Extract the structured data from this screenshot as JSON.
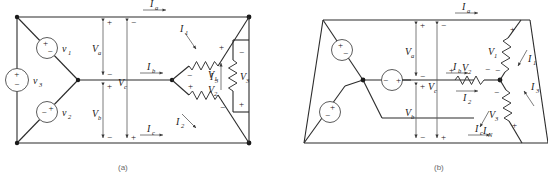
{
  "figure": {
    "caption_a": "(a)",
    "caption_b": "(b)"
  },
  "diagram_a": {
    "sources": [
      {
        "name": "v1",
        "label": "v",
        "sub": "1",
        "polarity_top": "+",
        "polarity_bottom": "−"
      },
      {
        "name": "v2",
        "label": "v",
        "sub": "2",
        "polarity_top": "−",
        "polarity_bottom": "+"
      },
      {
        "name": "v3",
        "label": "v",
        "sub": "3",
        "polarity_top": "+",
        "polarity_bottom": "−"
      }
    ],
    "resistors": [
      {
        "name": "V1",
        "label": "V",
        "sub": "1",
        "sign_near": "+",
        "sign_far": "−"
      },
      {
        "name": "V2",
        "label": "V",
        "sub": "2",
        "sign_near": "+",
        "sign_far": "−"
      },
      {
        "name": "V3",
        "label": "V",
        "sub": "3",
        "sign_near": "−",
        "sign_far": "+"
      }
    ],
    "line_voltages": [
      {
        "name": "Va",
        "label": "V",
        "sub": "a",
        "sign_top": "+",
        "sign_bottom": "−"
      },
      {
        "name": "Vb",
        "label": "V",
        "sub": "b",
        "sign_top": "+",
        "sign_bottom": "−"
      },
      {
        "name": "Vc",
        "label": "V",
        "sub": "c",
        "sign_top": "−",
        "sign_bottom": "+"
      }
    ],
    "line_currents": [
      {
        "name": "Ia",
        "label": "I",
        "sub": "a",
        "direction": "right"
      },
      {
        "name": "Ib",
        "label": "I",
        "sub": "b",
        "direction": "right"
      },
      {
        "name": "Ic",
        "label": "I",
        "sub": "c",
        "direction": "right"
      }
    ],
    "branch_currents": [
      {
        "name": "I1",
        "label": "I",
        "sub": "1",
        "direction": "down-right"
      },
      {
        "name": "I2",
        "label": "I",
        "sub": "2",
        "direction": "down-right"
      },
      {
        "name": "I3",
        "label": "I",
        "sub": "3",
        "direction": "up"
      }
    ]
  },
  "diagram_b": {
    "sources": [
      {
        "name": "vtop",
        "polarity_top": "+",
        "polarity_bottom": "−"
      },
      {
        "name": "vbottom",
        "polarity_top": "+",
        "polarity_bottom": "−"
      },
      {
        "name": "vmiddle",
        "polarity_left": "−",
        "polarity_right": "+"
      }
    ],
    "resistors": [
      {
        "name": "V2",
        "label": "V",
        "sub": "2",
        "sign_left": "+",
        "sign_right": "−"
      },
      {
        "name": "V1",
        "label": "V",
        "sub": "1",
        "sign_top": "+",
        "sign_bottom": "−"
      },
      {
        "name": "V3",
        "label": "V",
        "sub": "3",
        "sign_top": "−",
        "sign_bottom": "+"
      }
    ],
    "line_voltages": [
      {
        "name": "Va",
        "label": "V",
        "sub": "a",
        "sign_top": "+",
        "sign_bottom": "−"
      },
      {
        "name": "Vb",
        "label": "V",
        "sub": "b",
        "sign_top": "+",
        "sign_bottom": "−"
      },
      {
        "name": "Vc",
        "label": "V",
        "sub": "c",
        "sign_top": "−",
        "sign_bottom": "+"
      }
    ],
    "line_currents": [
      {
        "name": "Ia",
        "label": "I",
        "sub": "a",
        "direction": "right"
      },
      {
        "name": "Ib",
        "label": "I",
        "sub": "b",
        "direction": "right"
      },
      {
        "name": "Ic",
        "label": "I",
        "sub": "c",
        "direction": "right"
      }
    ],
    "branch_currents": [
      {
        "name": "I1",
        "label": "I",
        "sub": "1",
        "direction": "down-left"
      },
      {
        "name": "I2",
        "label": "I",
        "sub": "2",
        "direction": "right"
      },
      {
        "name": "I3",
        "label": "I",
        "sub": "3",
        "direction": "up-left"
      },
      {
        "name": "IN",
        "label": "I",
        "sub": "N",
        "direction": "down-left"
      }
    ]
  },
  "colors": {
    "wire": "#2b2b2b",
    "thin": "#5a5a5a",
    "text": "#1a1a1a",
    "caption": "#6a6a6a",
    "background": "#ffffff"
  }
}
